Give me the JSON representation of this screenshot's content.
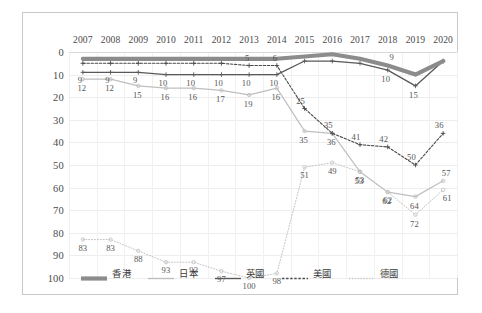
{
  "chart_data": {
    "type": "line",
    "title": "",
    "subtitle": "",
    "xlabel": "",
    "ylabel": "",
    "categories": [
      "2007",
      "2008",
      "2009",
      "2010",
      "2011",
      "2012",
      "2013",
      "2014",
      "2015",
      "2016",
      "2017",
      "2018",
      "2019",
      "2020"
    ],
    "x": [
      2007,
      2008,
      2009,
      2010,
      2011,
      2012,
      2013,
      2014,
      2015,
      2016,
      2017,
      2018,
      2019,
      2020
    ],
    "ylim": [
      0,
      100
    ],
    "y_inverted": true,
    "yticks": [
      0,
      10,
      20,
      30,
      40,
      50,
      60,
      70,
      80,
      90,
      100
    ],
    "grid": true,
    "legend_position": "bottom",
    "series": [
      {
        "name": "香港",
        "color": "#8c8c8c",
        "style": "solid-thick",
        "values": [
          3,
          3,
          3,
          3,
          3,
          3,
          3,
          3,
          2,
          1,
          3,
          6,
          10,
          4
        ],
        "labels": [
          "",
          "",
          "",
          "",
          "",
          "",
          "",
          "",
          "",
          "",
          "",
          "9",
          "",
          ""
        ]
      },
      {
        "name": "日本",
        "color": "#bfbfbf",
        "style": "solid-thin",
        "values": [
          12,
          12,
          15,
          16,
          16,
          17,
          19,
          16,
          35,
          36,
          53,
          62,
          64,
          57
        ],
        "labels": [
          "12",
          "12",
          "15",
          "16",
          "16",
          "17",
          "19",
          "16",
          "35",
          "36",
          "53",
          "62",
          "64",
          "57"
        ]
      },
      {
        "name": "英國",
        "color": "#595959",
        "style": "solid-dark",
        "values": [
          9,
          9,
          9,
          10,
          10,
          10,
          10,
          10,
          4,
          4,
          5,
          8,
          15,
          4
        ],
        "labels": [
          "9",
          "9",
          "9",
          "10",
          "10",
          "10",
          "10",
          "10",
          "",
          "",
          "",
          "10",
          "15",
          ""
        ]
      },
      {
        "name": "美國",
        "color": "#4a4a4a",
        "style": "dashed",
        "values": [
          5,
          5,
          5,
          5,
          5,
          5,
          6,
          6,
          25,
          36,
          41,
          42,
          50,
          36
        ],
        "labels": [
          "",
          "",
          "",
          "",
          "",
          "",
          "5",
          "6",
          "25",
          "35",
          "41",
          "42",
          "50",
          "36"
        ]
      },
      {
        "name": "德國",
        "color": "#c4c4c4",
        "style": "dotted",
        "values": [
          83,
          83,
          88,
          93,
          93,
          97,
          100,
          98,
          51,
          49,
          53,
          62,
          72,
          61
        ],
        "labels": [
          "83",
          "83",
          "88",
          "93",
          "93",
          "97",
          "100",
          "98",
          "51",
          "49",
          "53",
          "62",
          "72",
          "61"
        ]
      }
    ]
  }
}
